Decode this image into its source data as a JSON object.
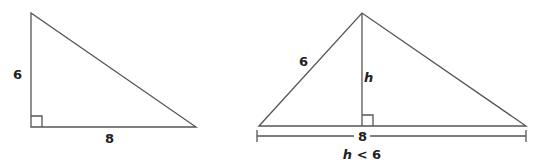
{
  "diagram": {
    "left_triangle": {
      "vertical_leg_label": "6",
      "base_label": "8",
      "right_angle": true
    },
    "right_triangle": {
      "side_label": "6",
      "height_label": "h",
      "base_label": "8",
      "right_angle": true
    },
    "condition": {
      "variable": "h",
      "relation": " < 6"
    },
    "colors": {
      "stroke": "#555555",
      "text": "#222222"
    }
  }
}
